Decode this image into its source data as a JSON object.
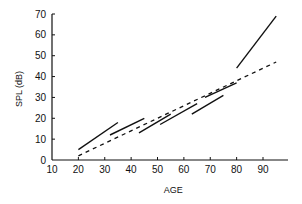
{
  "chart_data": {
    "type": "line",
    "title": "",
    "xlabel": "AGE",
    "ylabel": "SPL (dB)",
    "xlim": [
      10,
      100
    ],
    "ylim": [
      0,
      70
    ],
    "x_ticks": [
      10,
      20,
      30,
      40,
      50,
      60,
      70,
      80,
      90
    ],
    "y_ticks": [
      0,
      10,
      20,
      30,
      40,
      50,
      60,
      70
    ],
    "grid": false,
    "legend": "none",
    "series": [
      {
        "name": "segment-1",
        "style": "solid",
        "points": [
          [
            20,
            5
          ],
          [
            35,
            18
          ]
        ]
      },
      {
        "name": "segment-2",
        "style": "solid",
        "points": [
          [
            32,
            12
          ],
          [
            45,
            20
          ]
        ]
      },
      {
        "name": "segment-3",
        "style": "solid",
        "points": [
          [
            43,
            13
          ],
          [
            55,
            22
          ]
        ]
      },
      {
        "name": "segment-4",
        "style": "solid",
        "points": [
          [
            51,
            17
          ],
          [
            65,
            27
          ]
        ]
      },
      {
        "name": "segment-5",
        "style": "solid",
        "points": [
          [
            63,
            22
          ],
          [
            75,
            31
          ]
        ]
      },
      {
        "name": "segment-6",
        "style": "solid",
        "points": [
          [
            68,
            30
          ],
          [
            80,
            37
          ]
        ]
      },
      {
        "name": "segment-7",
        "style": "solid",
        "points": [
          [
            80,
            44
          ],
          [
            95,
            69
          ]
        ]
      },
      {
        "name": "overall-fit",
        "style": "dashed",
        "points": [
          [
            20,
            2
          ],
          [
            95,
            47
          ]
        ]
      }
    ]
  }
}
